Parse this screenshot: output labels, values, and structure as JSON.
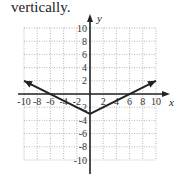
{
  "caption": "vertically.",
  "chart_data": {
    "type": "line",
    "title": "",
    "xlabel": "x",
    "ylabel": "y",
    "xlim": [
      -10,
      10
    ],
    "ylim": [
      -10,
      10
    ],
    "grid": true,
    "x_ticks": [
      -10,
      -8,
      -6,
      -4,
      -2,
      2,
      4,
      6,
      8,
      10
    ],
    "y_ticks": [
      10,
      8,
      6,
      4,
      2,
      -2,
      -4,
      -6,
      -8,
      -10
    ],
    "x_tick_labels": [
      "-10",
      "-8",
      "-6",
      "-4",
      "-2",
      "2",
      "4",
      "6",
      "8",
      "10"
    ],
    "y_tick_labels": [
      "10",
      "8",
      "6",
      "4",
      "2",
      "-2",
      "-4",
      "-6",
      "-8",
      "-10"
    ],
    "series": [
      {
        "name": "y = 0.5|x| - 3",
        "x": [
          -10,
          0,
          10
        ],
        "y": [
          2,
          -3,
          2
        ],
        "arrows": "both-ends",
        "color": "#222222"
      }
    ]
  }
}
